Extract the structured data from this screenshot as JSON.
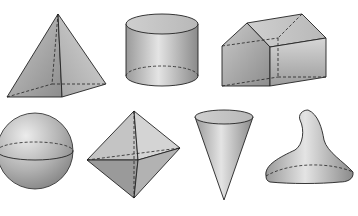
{
  "caption": "",
  "figure": {
    "shapes": [
      {
        "id": "pyramid",
        "name": "Square pyramid"
      },
      {
        "id": "cylinder",
        "name": "Cylinder"
      },
      {
        "id": "prism",
        "name": "Pentagonal prism (house shape)"
      },
      {
        "id": "sphere",
        "name": "Sphere"
      },
      {
        "id": "octahedron",
        "name": "Octahedron"
      },
      {
        "id": "cone",
        "name": "Cone (inverted)"
      },
      {
        "id": "kiss",
        "name": "Irregular solid (drop shape)"
      }
    ]
  },
  "colors": {
    "edge": "#222222",
    "fill_light": "#e2e2e2",
    "fill_mid": "#b5b5b5",
    "fill_dark": "#8e8e8e"
  }
}
